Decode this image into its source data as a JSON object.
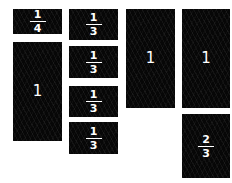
{
  "colors": {
    "block": "#070707",
    "text": "#ffffff",
    "background": "#ffffff"
  },
  "columns": [
    {
      "blocks": [
        {
          "type": "fraction",
          "numerator": "1",
          "denominator": "4"
        },
        {
          "type": "whole",
          "value": "1"
        }
      ]
    },
    {
      "blocks": [
        {
          "type": "fraction",
          "numerator": "1",
          "denominator": "3"
        },
        {
          "type": "fraction",
          "numerator": "1",
          "denominator": "3"
        },
        {
          "type": "fraction",
          "numerator": "1",
          "denominator": "3"
        },
        {
          "type": "fraction",
          "numerator": "1",
          "denominator": "3"
        }
      ]
    },
    {
      "blocks": [
        {
          "type": "whole",
          "value": "1"
        }
      ]
    },
    {
      "blocks": [
        {
          "type": "whole",
          "value": "1"
        },
        {
          "type": "fraction",
          "numerator": "2",
          "denominator": "3"
        }
      ]
    }
  ]
}
